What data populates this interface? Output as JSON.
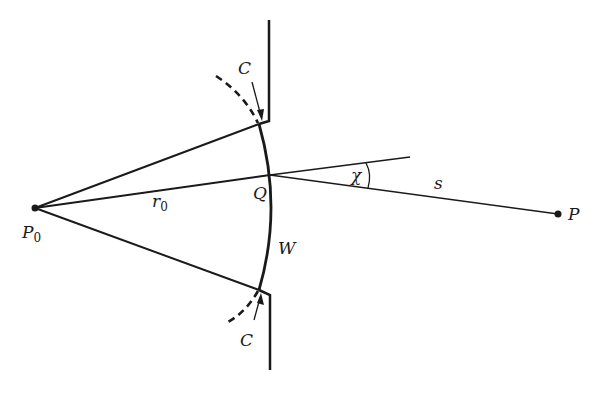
{
  "diagram": {
    "type": "diffraction-geometry",
    "labels": {
      "source_point": "P",
      "source_subscript": "0",
      "observation_point": "P",
      "aperture_point": "Q",
      "radius": "r",
      "radius_subscript": "0",
      "distance": "s",
      "angle": "χ",
      "wavefront": "W",
      "contour_top": "C",
      "contour_bottom": "C"
    },
    "colors": {
      "stroke": "#1a1a1a",
      "background": "#ffffff"
    }
  }
}
